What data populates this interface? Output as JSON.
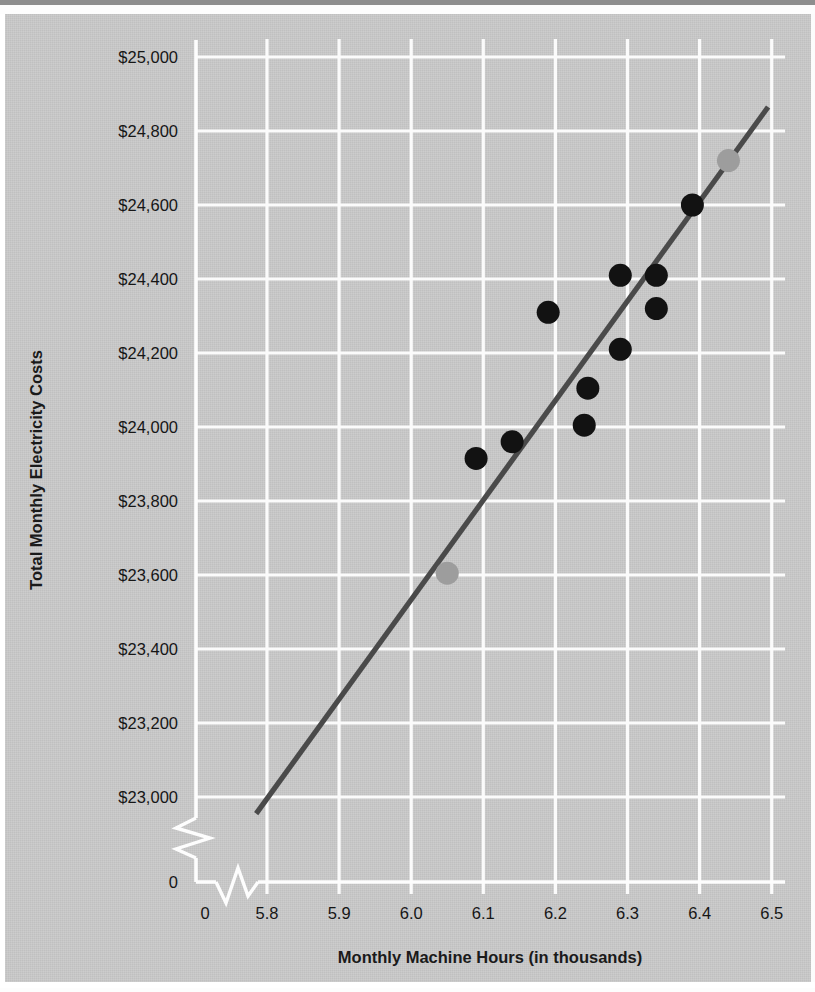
{
  "figure": {
    "background_color": "#c9c9c9",
    "grid_color": "#fbfbfb",
    "line_color": "#4a4a4a",
    "point_color": "#121212",
    "highlight_point_color": "#9d9d9d"
  },
  "axes": {
    "y_title": "Total Monthly Electricity Costs",
    "x_title": "Monthly Machine Hours (in thousands)",
    "y_ticks": [
      "0",
      "$23,000",
      "$23,200",
      "$23,400",
      "$23,600",
      "$23,800",
      "$24,000",
      "$24,200",
      "$24,400",
      "$24,600",
      "$24,800",
      "$25,000"
    ],
    "x_ticks": [
      "0",
      "5.8",
      "5.9",
      "6.0",
      "6.1",
      "6.2",
      "6.3",
      "6.4",
      "6.5"
    ],
    "y_axis_break": true,
    "x_axis_break": true
  },
  "chart_data": {
    "type": "scatter",
    "title": "",
    "xlabel": "Monthly Machine Hours (in thousands)",
    "ylabel": "Total Monthly Electricity Costs",
    "xlim": [
      5.75,
      6.5
    ],
    "ylim": [
      22900,
      25000
    ],
    "xticks": [
      5.8,
      5.9,
      6.0,
      6.1,
      6.2,
      6.3,
      6.4,
      6.5
    ],
    "yticks": [
      23000,
      23200,
      23400,
      23600,
      23800,
      24000,
      24200,
      24400,
      24600,
      24800,
      25000
    ],
    "ytick_labels": [
      "$23,000",
      "$23,200",
      "$23,400",
      "$23,600",
      "$23,800",
      "$24,000",
      "$24,200",
      "$24,400",
      "$24,600",
      "$24,800",
      "$25,000"
    ],
    "xtick_labels": [
      "5.8",
      "5.9",
      "6.0",
      "6.1",
      "6.2",
      "6.3",
      "6.4",
      "6.5"
    ],
    "grid": true,
    "legend": null,
    "y_axis_break_after": 0,
    "x_axis_break_after": 0,
    "series": [
      {
        "name": "Observed monthly cost",
        "marker": "filled-circle",
        "color": "#121212",
        "points": [
          {
            "x": 6.09,
            "y": 23915
          },
          {
            "x": 6.14,
            "y": 23960
          },
          {
            "x": 6.19,
            "y": 24310
          },
          {
            "x": 6.24,
            "y": 24005
          },
          {
            "x": 6.245,
            "y": 24105
          },
          {
            "x": 6.29,
            "y": 24210
          },
          {
            "x": 6.29,
            "y": 24410
          },
          {
            "x": 6.34,
            "y": 24320
          },
          {
            "x": 6.34,
            "y": 24410
          },
          {
            "x": 6.39,
            "y": 24600
          }
        ]
      },
      {
        "name": "High-low endpoints",
        "marker": "filled-circle",
        "color": "#9d9d9d",
        "points": [
          {
            "x": 6.05,
            "y": 23605
          },
          {
            "x": 6.44,
            "y": 24720
          }
        ]
      }
    ],
    "trendline": {
      "name": "Cost estimation line",
      "color": "#4a4a4a",
      "x_start": 5.785,
      "y_start": 22955,
      "x_end": 6.495,
      "y_end": 24865
    }
  }
}
